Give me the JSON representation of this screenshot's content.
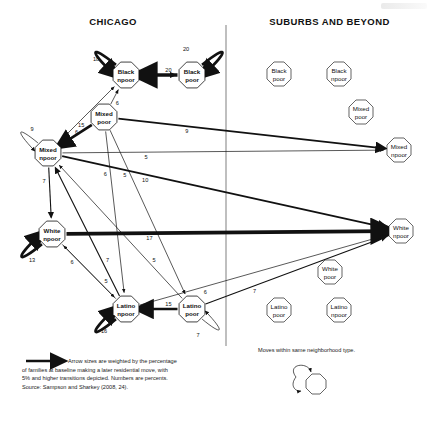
{
  "figure": {
    "headers": {
      "left": "CHICAGO",
      "right": "SUBURBS AND BEYOND"
    },
    "legend": {
      "arrow_note_line1": "Arrow sizes are weighted by the percentage",
      "arrow_note_line2": "of families at baseline making a later residential move, with",
      "arrow_note_line3": "5% and higher transitions depicted. Numbers are percents.",
      "source": "Source: Sampson and Sharkey (2008, 24).",
      "selfloop_note": "Moves within same neighborhood type."
    }
  },
  "chart_data": {
    "type": "diagram",
    "units": "percent",
    "nodes": [
      {
        "id": "chi_black_npoor",
        "label_line1": "Black",
        "label_line2": "npoor",
        "region": "Chicago",
        "x": 126,
        "y": 75
      },
      {
        "id": "chi_black_poor",
        "label_line1": "Black",
        "label_line2": "poor",
        "region": "Chicago",
        "x": 192,
        "y": 75
      },
      {
        "id": "chi_mixed_poor",
        "label_line1": "Mixed",
        "label_line2": "poor",
        "region": "Chicago",
        "x": 104,
        "y": 117
      },
      {
        "id": "chi_mixed_npoor",
        "label_line1": "Mixed",
        "label_line2": "npoor",
        "region": "Chicago",
        "x": 48,
        "y": 153
      },
      {
        "id": "chi_white_npoor",
        "label_line1": "White",
        "label_line2": "npoor",
        "region": "Chicago",
        "x": 52,
        "y": 234
      },
      {
        "id": "chi_latino_npoor",
        "label_line1": "Latino",
        "label_line2": "npoor",
        "region": "Chicago",
        "x": 126,
        "y": 309
      },
      {
        "id": "chi_latino_poor",
        "label_line1": "Latino",
        "label_line2": "poor",
        "region": "Chicago",
        "x": 192,
        "y": 309
      },
      {
        "id": "sub_black_poor",
        "label_line1": "Black",
        "label_line2": "poor",
        "region": "Suburbs",
        "x": 279,
        "y": 74
      },
      {
        "id": "sub_black_npoor",
        "label_line1": "Black",
        "label_line2": "npoor",
        "region": "Suburbs",
        "x": 339,
        "y": 74
      },
      {
        "id": "sub_mixed_poor",
        "label_line1": "Mixed",
        "label_line2": "poor",
        "region": "Suburbs",
        "x": 361,
        "y": 112
      },
      {
        "id": "sub_mixed_npoor",
        "label_line1": "Mixed",
        "label_line2": "npoor",
        "region": "Suburbs",
        "x": 399,
        "y": 150
      },
      {
        "id": "sub_white_npoor",
        "label_line1": "White",
        "label_line2": "npoor",
        "region": "Suburbs",
        "x": 401,
        "y": 231
      },
      {
        "id": "sub_white_poor",
        "label_line1": "White",
        "label_line2": "poor",
        "region": "Suburbs",
        "x": 330,
        "y": 272
      },
      {
        "id": "sub_latino_poor",
        "label_line1": "Latino",
        "label_line2": "poor",
        "region": "Suburbs",
        "x": 279,
        "y": 310
      },
      {
        "id": "sub_latino_npoor",
        "label_line1": "Latino",
        "label_line2": "npoor",
        "region": "Suburbs",
        "x": 339,
        "y": 310
      }
    ],
    "self_loops": [
      {
        "node": "chi_black_npoor",
        "value": 18
      },
      {
        "node": "chi_black_poor",
        "value": 20
      },
      {
        "node": "chi_mixed_npoor",
        "value": 9
      },
      {
        "node": "chi_white_npoor",
        "value": 13
      },
      {
        "node": "chi_latino_npoor",
        "value": 16
      },
      {
        "node": "chi_latino_poor",
        "value": 7
      }
    ],
    "edges": [
      {
        "from": "chi_black_npoor",
        "to": "chi_black_poor",
        "value": 7
      },
      {
        "from": "chi_black_poor",
        "to": "chi_black_npoor",
        "value": 20
      },
      {
        "from": "chi_mixed_poor",
        "to": "chi_black_npoor",
        "value": 6
      },
      {
        "from": "chi_mixed_npoor",
        "to": "chi_black_npoor",
        "value": 6
      },
      {
        "from": "chi_mixed_poor",
        "to": "chi_mixed_npoor",
        "value": 15
      },
      {
        "from": "chi_mixed_poor",
        "to": "sub_mixed_npoor",
        "value": 9
      },
      {
        "from": "chi_mixed_poor",
        "to": "chi_latino_npoor",
        "value": 6
      },
      {
        "from": "chi_mixed_poor",
        "to": "chi_latino_poor",
        "value": 5
      },
      {
        "from": "chi_mixed_npoor",
        "to": "sub_mixed_npoor",
        "value": 5
      },
      {
        "from": "chi_mixed_npoor",
        "to": "sub_white_npoor",
        "value": 10
      },
      {
        "from": "chi_mixed_npoor",
        "to": "chi_white_npoor",
        "value": 7
      },
      {
        "from": "chi_latino_npoor",
        "to": "chi_mixed_npoor",
        "value": 7
      },
      {
        "from": "chi_white_npoor",
        "to": "sub_white_npoor",
        "value": 17
      },
      {
        "from": "chi_latino_npoor",
        "to": "chi_white_npoor",
        "value": 5
      },
      {
        "from": "chi_latino_npoor",
        "to": "sub_white_npoor",
        "value": 6
      },
      {
        "from": "chi_white_npoor",
        "to": "chi_latino_npoor",
        "value": 6
      },
      {
        "from": "chi_latino_poor",
        "to": "chi_latino_npoor",
        "value": 15
      },
      {
        "from": "chi_latino_poor",
        "to": "sub_white_npoor",
        "value": 7
      },
      {
        "from": "chi_latino_poor",
        "to": "chi_mixed_npoor",
        "value": 5
      }
    ]
  }
}
